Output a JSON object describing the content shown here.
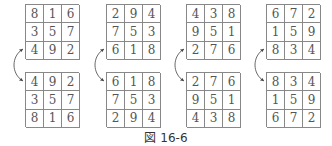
{
  "figure": {
    "caption": "図 16-6",
    "panels": [
      {
        "top": [
          [
            "8",
            "1",
            "6"
          ],
          [
            "3",
            "5",
            "7"
          ],
          [
            "4",
            "9",
            "2"
          ]
        ],
        "bottom": [
          [
            "4",
            "9",
            "2"
          ],
          [
            "3",
            "5",
            "7"
          ],
          [
            "8",
            "1",
            "6"
          ]
        ]
      },
      {
        "top": [
          [
            "2",
            "9",
            "4"
          ],
          [
            "7",
            "5",
            "3"
          ],
          [
            "6",
            "1",
            "8"
          ]
        ],
        "bottom": [
          [
            "6",
            "1",
            "8"
          ],
          [
            "7",
            "5",
            "3"
          ],
          [
            "2",
            "9",
            "4"
          ]
        ]
      },
      {
        "top": [
          [
            "4",
            "3",
            "8"
          ],
          [
            "9",
            "5",
            "1"
          ],
          [
            "2",
            "7",
            "6"
          ]
        ],
        "bottom": [
          [
            "2",
            "7",
            "6"
          ],
          [
            "9",
            "5",
            "1"
          ],
          [
            "4",
            "3",
            "8"
          ]
        ]
      },
      {
        "top": [
          [
            "6",
            "7",
            "2"
          ],
          [
            "1",
            "5",
            "9"
          ],
          [
            "8",
            "3",
            "4"
          ]
        ],
        "bottom": [
          [
            "8",
            "3",
            "4"
          ],
          [
            "1",
            "5",
            "9"
          ],
          [
            "6",
            "7",
            "2"
          ]
        ]
      }
    ],
    "arrow_meaning": "swap top and bottom rows (flip vertically)"
  }
}
